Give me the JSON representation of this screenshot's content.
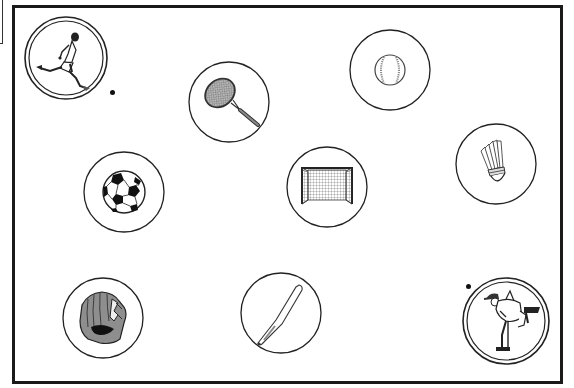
{
  "worksheet": {
    "frame_color": "#1a1a1a",
    "items": [
      {
        "id": "soccer-player",
        "label": "soccer player kicking",
        "cx": 66,
        "cy": 58,
        "r": 42,
        "double_ring": true,
        "marked": true
      },
      {
        "id": "tennis-racket",
        "label": "tennis racket",
        "cx": 229,
        "cy": 102,
        "r": 40,
        "double_ring": false,
        "marked": false
      },
      {
        "id": "baseball",
        "label": "baseball",
        "cx": 390,
        "cy": 70,
        "r": 40,
        "double_ring": false,
        "marked": false
      },
      {
        "id": "shuttlecock",
        "label": "badminton shuttlecock",
        "cx": 496,
        "cy": 164,
        "r": 40,
        "double_ring": false,
        "marked": false
      },
      {
        "id": "soccer-ball",
        "label": "soccer ball",
        "cx": 124,
        "cy": 192,
        "r": 40,
        "double_ring": false,
        "marked": false
      },
      {
        "id": "soccer-goal",
        "label": "soccer goal",
        "cx": 327,
        "cy": 187,
        "r": 40,
        "double_ring": false,
        "marked": false
      },
      {
        "id": "baseball-glove",
        "label": "baseball glove",
        "cx": 103,
        "cy": 318,
        "r": 40,
        "double_ring": false,
        "marked": false
      },
      {
        "id": "baseball-bat",
        "label": "baseball bat",
        "cx": 281,
        "cy": 313,
        "r": 40,
        "double_ring": false,
        "marked": false
      },
      {
        "id": "baseball-pitcher",
        "label": "baseball pitcher throwing",
        "cx": 506,
        "cy": 321,
        "r": 44,
        "double_ring": true,
        "marked": true
      }
    ],
    "dots": [
      {
        "for": "soccer-player",
        "x": 112,
        "y": 92
      },
      {
        "for": "baseball-pitcher",
        "x": 468,
        "y": 286
      }
    ]
  }
}
